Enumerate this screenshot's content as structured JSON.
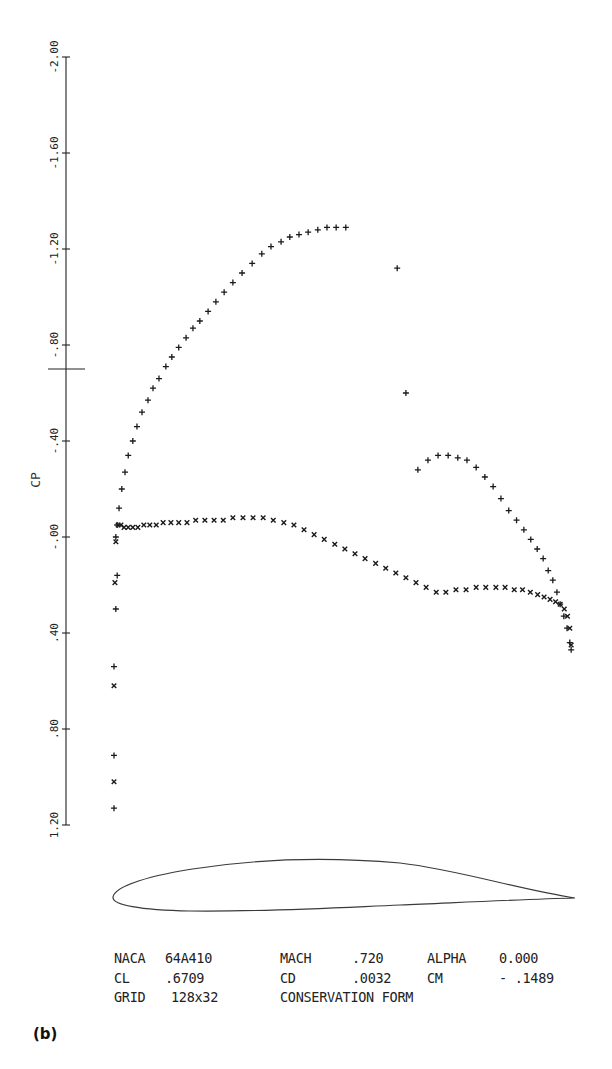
{
  "chart_data": {
    "type": "scatter",
    "title": "",
    "xlabel": "",
    "ylabel": "CP",
    "y_axis_inverted": true,
    "ylim": [
      -2.0,
      1.2
    ],
    "yticks": [
      -2.0,
      -1.6,
      -1.2,
      -0.8,
      -0.4,
      0.0,
      0.4,
      0.8,
      1.2
    ],
    "ytick_labels": [
      "-2.00",
      "-1.60",
      "-1.20",
      "-.80",
      "-.40",
      "-.00",
      ".40",
      ".80",
      "1.20"
    ],
    "critical_cp_marker": -0.7,
    "grid": false,
    "legend": null,
    "xlim": [
      0.0,
      1.0
    ],
    "x_quantity": "x/c (chord fraction, inferred from airfoil below)",
    "series": [
      {
        "name": "upper surface",
        "marker": "+",
        "points": [
          [
            0.0,
            1.13
          ],
          [
            0.0,
            0.91
          ],
          [
            0.0,
            0.54
          ],
          [
            0.004,
            0.3
          ],
          [
            0.007,
            0.16
          ],
          [
            0.004,
            0.0
          ],
          [
            0.007,
            -0.05
          ],
          [
            0.011,
            -0.12
          ],
          [
            0.017,
            -0.2
          ],
          [
            0.024,
            -0.27
          ],
          [
            0.031,
            -0.34
          ],
          [
            0.041,
            -0.4
          ],
          [
            0.05,
            -0.46
          ],
          [
            0.061,
            -0.52
          ],
          [
            0.074,
            -0.57
          ],
          [
            0.085,
            -0.62
          ],
          [
            0.098,
            -0.66
          ],
          [
            0.113,
            -0.71
          ],
          [
            0.126,
            -0.75
          ],
          [
            0.141,
            -0.79
          ],
          [
            0.157,
            -0.83
          ],
          [
            0.172,
            -0.87
          ],
          [
            0.187,
            -0.9
          ],
          [
            0.205,
            -0.94
          ],
          [
            0.222,
            -0.98
          ],
          [
            0.24,
            -1.02
          ],
          [
            0.259,
            -1.06
          ],
          [
            0.279,
            -1.1
          ],
          [
            0.301,
            -1.14
          ],
          [
            0.322,
            -1.18
          ],
          [
            0.342,
            -1.21
          ],
          [
            0.364,
            -1.23
          ],
          [
            0.383,
            -1.25
          ],
          [
            0.403,
            -1.26
          ],
          [
            0.423,
            -1.27
          ],
          [
            0.444,
            -1.28
          ],
          [
            0.464,
            -1.29
          ],
          [
            0.484,
            -1.29
          ],
          [
            0.505,
            -1.29
          ],
          [
            0.617,
            -1.12
          ],
          [
            0.636,
            -0.6
          ],
          [
            0.662,
            -0.28
          ],
          [
            0.684,
            -0.32
          ],
          [
            0.706,
            -0.34
          ],
          [
            0.728,
            -0.34
          ],
          [
            0.749,
            -0.33
          ],
          [
            0.769,
            -0.32
          ],
          [
            0.789,
            -0.29
          ],
          [
            0.808,
            -0.25
          ],
          [
            0.826,
            -0.21
          ],
          [
            0.843,
            -0.16
          ],
          [
            0.86,
            -0.11
          ],
          [
            0.877,
            -0.07
          ],
          [
            0.893,
            -0.03
          ],
          [
            0.908,
            0.01
          ],
          [
            0.922,
            0.05
          ],
          [
            0.935,
            0.09
          ],
          [
            0.946,
            0.14
          ],
          [
            0.956,
            0.18
          ],
          [
            0.965,
            0.23
          ],
          [
            0.972,
            0.28
          ],
          [
            0.98,
            0.33
          ],
          [
            0.987,
            0.38
          ],
          [
            0.993,
            0.44
          ],
          [
            0.996,
            0.47
          ]
        ]
      },
      {
        "name": "lower surface",
        "marker": "x",
        "points": [
          [
            0.0,
            1.02
          ],
          [
            0.0,
            0.62
          ],
          [
            0.002,
            0.19
          ],
          [
            0.004,
            0.02
          ],
          [
            0.009,
            -0.05
          ],
          [
            0.015,
            -0.05
          ],
          [
            0.022,
            -0.04
          ],
          [
            0.031,
            -0.04
          ],
          [
            0.041,
            -0.04
          ],
          [
            0.052,
            -0.04
          ],
          [
            0.065,
            -0.05
          ],
          [
            0.078,
            -0.05
          ],
          [
            0.092,
            -0.05
          ],
          [
            0.107,
            -0.06
          ],
          [
            0.124,
            -0.06
          ],
          [
            0.141,
            -0.06
          ],
          [
            0.159,
            -0.06
          ],
          [
            0.178,
            -0.07
          ],
          [
            0.198,
            -0.07
          ],
          [
            0.218,
            -0.07
          ],
          [
            0.238,
            -0.07
          ],
          [
            0.259,
            -0.08
          ],
          [
            0.281,
            -0.08
          ],
          [
            0.303,
            -0.08
          ],
          [
            0.325,
            -0.08
          ],
          [
            0.347,
            -0.07
          ],
          [
            0.37,
            -0.06
          ],
          [
            0.392,
            -0.05
          ],
          [
            0.414,
            -0.03
          ],
          [
            0.436,
            -0.01
          ],
          [
            0.458,
            0.01
          ],
          [
            0.481,
            0.03
          ],
          [
            0.503,
            0.05
          ],
          [
            0.525,
            0.07
          ],
          [
            0.547,
            0.09
          ],
          [
            0.57,
            0.11
          ],
          [
            0.592,
            0.13
          ],
          [
            0.614,
            0.15
          ],
          [
            0.636,
            0.17
          ],
          [
            0.658,
            0.19
          ],
          [
            0.68,
            0.21
          ],
          [
            0.702,
            0.23
          ],
          [
            0.723,
            0.23
          ],
          [
            0.745,
            0.22
          ],
          [
            0.767,
            0.22
          ],
          [
            0.789,
            0.21
          ],
          [
            0.81,
            0.21
          ],
          [
            0.832,
            0.21
          ],
          [
            0.852,
            0.21
          ],
          [
            0.872,
            0.22
          ],
          [
            0.89,
            0.22
          ],
          [
            0.907,
            0.23
          ],
          [
            0.923,
            0.24
          ],
          [
            0.937,
            0.25
          ],
          [
            0.95,
            0.26
          ],
          [
            0.962,
            0.27
          ],
          [
            0.972,
            0.28
          ],
          [
            0.981,
            0.3
          ],
          [
            0.988,
            0.33
          ],
          [
            0.993,
            0.38
          ],
          [
            0.996,
            0.45
          ]
        ]
      }
    ],
    "annotations": [
      "NACA 64A410",
      "CL .6709",
      "GRID 128x32",
      "MACH .720",
      "CD .0032",
      "CONSERVATION FORM",
      "ALPHA 0.000",
      "CM - .1489"
    ]
  },
  "info": {
    "airfoil_label": "NACA",
    "airfoil_value": "64A410",
    "cl_label": "CL",
    "cl_value": ".6709",
    "grid_label": "GRID",
    "grid_value": "128x32",
    "mach_label": "MACH",
    "mach_value": ".720",
    "cd_label": "CD",
    "cd_value": ".0032",
    "form_label": "CONSERVATION FORM",
    "alpha_label": "ALPHA",
    "alpha_value": "0.000",
    "cm_label": "CM",
    "cm_value": "- .1489"
  },
  "panel_label": "(b)",
  "colors": {
    "ink": "#1a1a1a",
    "paper": "#ffffff"
  }
}
